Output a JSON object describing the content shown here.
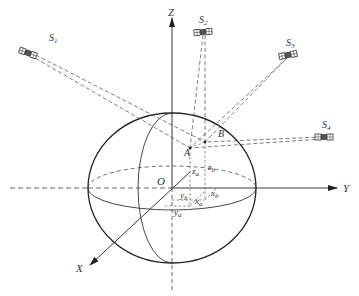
{
  "diagram": {
    "type": "gnss-positioning-geometry",
    "axes": {
      "x_label": "X",
      "y_label": "Y",
      "z_label": "Z",
      "origin_label": "O"
    },
    "satellites": [
      {
        "id": "S1",
        "label": "S",
        "sub": "1",
        "x": 28,
        "y": 53
      },
      {
        "id": "S2",
        "label": "S",
        "sub": "2",
        "x": 203,
        "y": 32
      },
      {
        "id": "S3",
        "label": "S",
        "sub": "3",
        "x": 288,
        "y": 55
      },
      {
        "id": "S4",
        "label": "S",
        "sub": "4",
        "x": 324,
        "y": 137
      }
    ],
    "points": {
      "A": {
        "label": "A",
        "x": 190,
        "y": 148
      },
      "B": {
        "label": "B",
        "x": 205,
        "y": 142
      }
    },
    "coordinate_labels": {
      "za": {
        "main": "z",
        "sub": "a"
      },
      "zb": {
        "main": "z",
        "sub": "b"
      },
      "xa": {
        "main": "x",
        "sub": "a"
      },
      "xb": {
        "main": "x",
        "sub": "b"
      },
      "ya": {
        "main": "y",
        "sub": "a"
      },
      "yb": {
        "main": "y",
        "sub": "b"
      }
    },
    "colors": {
      "line": "#222222",
      "dashed": "#444444",
      "label": "#333333"
    }
  }
}
